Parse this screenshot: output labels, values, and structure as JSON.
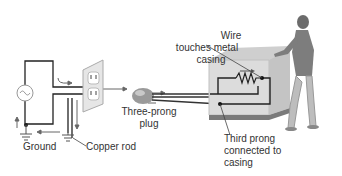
{
  "labels": {
    "wire_touches": [
      "Wire",
      "touches metal",
      "casing"
    ],
    "three_prong": [
      "Three-prong",
      "plug"
    ],
    "third_prong": [
      "Third prong",
      "connected to",
      "casing"
    ],
    "ground": "Ground",
    "copper_rod": "Copper rod"
  },
  "colors": {
    "line": "#222222",
    "arrow": "#555555",
    "casing": "#d8d8d8",
    "casing_dark": "#b5b5b5",
    "person": "#8a8a8a",
    "text": "#333333"
  }
}
